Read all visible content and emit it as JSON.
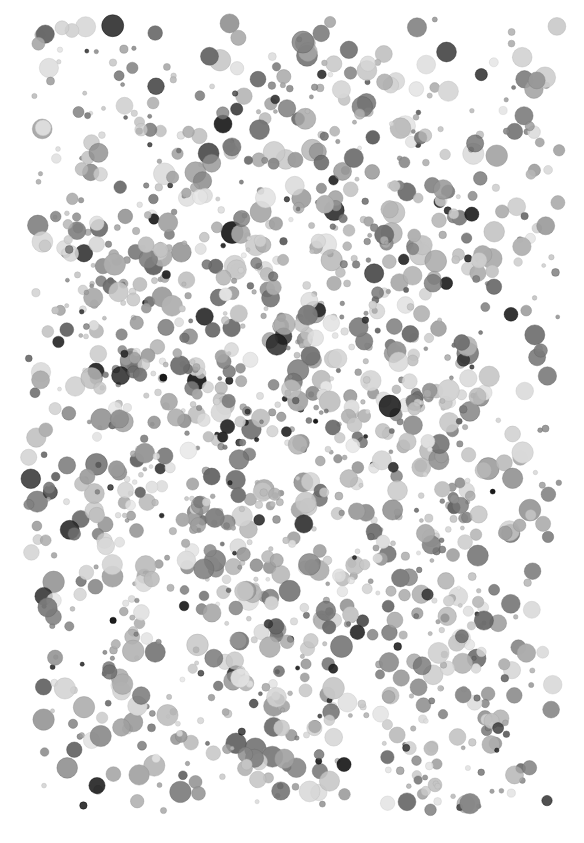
{
  "image": {
    "description": "Abstract field of grayscale circular dots of varied size and darkness on white background",
    "width": 584,
    "height": 843,
    "background": "#ffffff",
    "field": {
      "x_min": 28,
      "x_max": 560,
      "y_min": 18,
      "y_max": 812,
      "center_x": 292,
      "center_y": 420
    },
    "dots": {
      "count": 1500,
      "radius_min": 2,
      "radius_max": 11,
      "tone_light": "#e2e2e2",
      "tone_mid": "#9a9a9a",
      "tone_dark": "#1a1a1a",
      "dark_fraction": 0.08,
      "seed": 7
    }
  }
}
